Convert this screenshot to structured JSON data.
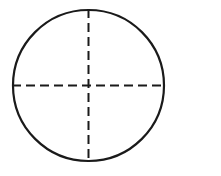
{
  "figure": {
    "name": "circle-with-centerlines",
    "title": "Circle with dashed horizontal and vertical centerlines",
    "canvas": {
      "width": 221,
      "height": 176,
      "background_color": "#FFFFFF"
    },
    "circle": {
      "label": "circle-outline",
      "center_x": 88.5,
      "center_y": 85.5,
      "radius": 75.5,
      "stroke_color": "#1A1A1A",
      "stroke_width": 2.2,
      "fill": "none"
    },
    "centerlines": [
      {
        "label": "horizontal-centerline",
        "orientation": "horizontal",
        "x1": 12,
        "y1": 85.5,
        "x2": 166,
        "y2": 85.5,
        "stroke_color": "#1A1A1A",
        "stroke_width": 2,
        "dash_pattern": "9 5"
      },
      {
        "label": "vertical-centerline",
        "orientation": "vertical",
        "x1": 88.5,
        "y1": 9,
        "x2": 88.5,
        "y2": 163,
        "stroke_color": "#1A1A1A",
        "stroke_width": 2,
        "dash_pattern": "9 5"
      }
    ],
    "center_point": {
      "label": "center-intersection",
      "x": 88.5,
      "y": 85.5
    },
    "annotations": []
  }
}
